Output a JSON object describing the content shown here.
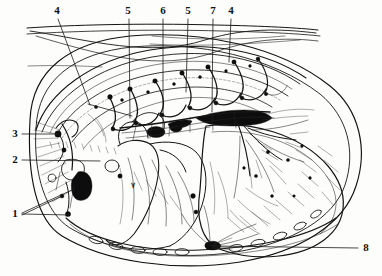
{
  "figure": {
    "style": "ink-line engraving, black on white",
    "width": 382,
    "height": 276,
    "ink_color": "#151515",
    "paper_color": "#fdfdfb"
  },
  "labels": [
    {
      "id": "label-4-left",
      "text": "4",
      "x": 57,
      "y": 11
    },
    {
      "id": "label-5-first",
      "text": "5",
      "x": 128,
      "y": 11
    },
    {
      "id": "label-6",
      "text": "6",
      "x": 163,
      "y": 11
    },
    {
      "id": "label-5-second",
      "text": "5",
      "x": 188,
      "y": 11
    },
    {
      "id": "label-7-top",
      "text": "7",
      "x": 213,
      "y": 11
    },
    {
      "id": "label-4-right",
      "text": "4",
      "x": 231,
      "y": 11
    },
    {
      "id": "label-3",
      "text": "3",
      "x": 15,
      "y": 134
    },
    {
      "id": "label-2",
      "text": "2",
      "x": 15,
      "y": 160
    },
    {
      "id": "label-1",
      "text": "1",
      "x": 15,
      "y": 214
    },
    {
      "id": "label-8",
      "text": "8",
      "x": 366,
      "y": 248
    }
  ],
  "leaders": [
    {
      "id": "leader-4-left",
      "path": "M 58 19 L 90 105"
    },
    {
      "id": "leader-4-left-b",
      "path": "M 88 104 L 132 116"
    },
    {
      "id": "leader-5-first",
      "path": "M 129 19 L 130 118"
    },
    {
      "id": "leader-6",
      "path": "M 163 19 L 163 135"
    },
    {
      "id": "leader-5-second",
      "path": "M 188 19 L 186 92"
    },
    {
      "id": "leader-7-top",
      "path": "M 213 19 L 212 112"
    },
    {
      "id": "leader-4-right",
      "path": "M 231 19 L 229 62"
    },
    {
      "id": "leader-3",
      "path": "M 22 134 L 58 134"
    },
    {
      "id": "leader-2",
      "path": "M 22 160 L 100 161"
    },
    {
      "id": "leader-1-a",
      "path": "M 22 213 L 72 190"
    },
    {
      "id": "leader-1-b",
      "path": "M 22 214 L 70 215"
    },
    {
      "id": "leader-1-c",
      "path": "M 22 215 L 62 196"
    },
    {
      "id": "leader-8",
      "path": "M 358 248 L 213 246"
    }
  ],
  "structures": {
    "chest_wall_label": "thoracic wall layers",
    "diaphragm_label": "diaphragm dome",
    "phrenic_branches_label": "radiating phrenic nerve branches",
    "sympathetic_trunk_label": "sympathetic trunk with ganglia",
    "intercostal_label": "intercostal spaces with nerve loops",
    "pericardium_label": "pericardium / mediastinal mass",
    "ganglia_label": "dark ganglion masses"
  },
  "legend_note": "Numbered leaders 1-8 point to anatomical structures"
}
